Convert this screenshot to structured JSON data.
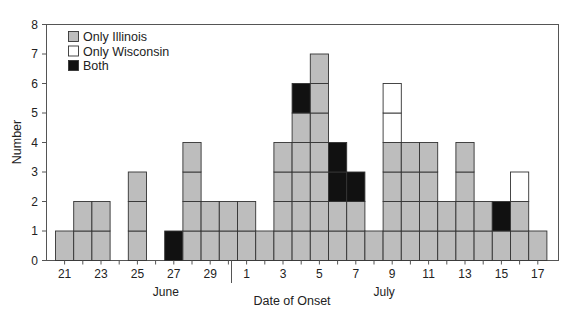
{
  "chart_data": {
    "type": "bar",
    "stacked": true,
    "title": "",
    "xlabel": "Date of Onset",
    "ylabel": "Number",
    "ylim": [
      0,
      8
    ],
    "yticks": [
      0,
      1,
      2,
      3,
      4,
      5,
      6,
      7,
      8
    ],
    "grid": false,
    "legend_position": "upper-left inside",
    "month_labels": [
      {
        "label": "June",
        "center_day_index": 6
      },
      {
        "label": "July",
        "center_day_index": 18
      }
    ],
    "categories": [
      "Jun 21",
      "Jun 22",
      "Jun 23",
      "Jun 24",
      "Jun 25",
      "Jun 26",
      "Jun 27",
      "Jun 28",
      "Jun 29",
      "Jun 30",
      "Jul 1",
      "Jul 2",
      "Jul 3",
      "Jul 4",
      "Jul 5",
      "Jul 6",
      "Jul 7",
      "Jul 8",
      "Jul 9",
      "Jul 10",
      "Jul 11",
      "Jul 12",
      "Jul 13",
      "Jul 14",
      "Jul 15",
      "Jul 16",
      "Jul 17"
    ],
    "xtick_labels": [
      {
        "index": 0,
        "label": "21"
      },
      {
        "index": 2,
        "label": "23"
      },
      {
        "index": 4,
        "label": "25"
      },
      {
        "index": 6,
        "label": "27"
      },
      {
        "index": 8,
        "label": "29"
      },
      {
        "index": 10,
        "label": "1"
      },
      {
        "index": 12,
        "label": "3"
      },
      {
        "index": 14,
        "label": "5"
      },
      {
        "index": 16,
        "label": "7"
      },
      {
        "index": 18,
        "label": "9"
      },
      {
        "index": 20,
        "label": "11"
      },
      {
        "index": 22,
        "label": "13"
      },
      {
        "index": 24,
        "label": "15"
      },
      {
        "index": 26,
        "label": "17"
      }
    ],
    "series": [
      {
        "name": "Only Illinois",
        "color": "#bdbdbd",
        "values": [
          1,
          2,
          2,
          0,
          3,
          0,
          0,
          4,
          2,
          2,
          2,
          1,
          4,
          5,
          7,
          2,
          2,
          1,
          4,
          4,
          4,
          2,
          4,
          2,
          1,
          2,
          1
        ]
      },
      {
        "name": "Both",
        "color": "#111111",
        "values": [
          0,
          0,
          0,
          0,
          0,
          0,
          1,
          0,
          0,
          0,
          0,
          0,
          0,
          1,
          0,
          2,
          1,
          0,
          0,
          0,
          0,
          0,
          0,
          0,
          1,
          0,
          0
        ]
      },
      {
        "name": "Only Wisconsin",
        "color": "#ffffff",
        "values": [
          0,
          0,
          0,
          0,
          0,
          0,
          0,
          0,
          0,
          0,
          0,
          0,
          0,
          0,
          0,
          0,
          0,
          0,
          2,
          0,
          0,
          0,
          0,
          0,
          0,
          1,
          0
        ]
      }
    ],
    "legend": [
      {
        "name": "Only Illinois",
        "color": "#bdbdbd"
      },
      {
        "name": "Only Wisconsin",
        "color": "#ffffff"
      },
      {
        "name": "Both",
        "color": "#111111"
      }
    ]
  }
}
